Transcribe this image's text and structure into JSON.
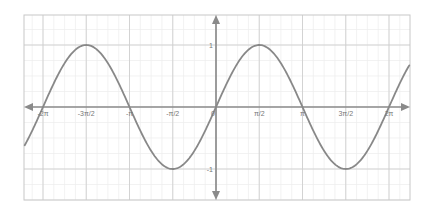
{
  "chart_data": {
    "type": "line",
    "title": "",
    "xlabel": "",
    "ylabel": "",
    "function": "y = sin(x)",
    "xlim": [
      -7.2,
      7.2
    ],
    "ylim": [
      -1.65,
      1.65
    ],
    "grid": true,
    "legend": null,
    "x_ticks": [
      {
        "value": -6.2832,
        "label": "-2π"
      },
      {
        "value": -4.7124,
        "label": "-3π/2"
      },
      {
        "value": -3.1416,
        "label": "-π"
      },
      {
        "value": -1.5708,
        "label": "-π/2"
      },
      {
        "value": 0,
        "label": "0"
      },
      {
        "value": 1.5708,
        "label": "π/2"
      },
      {
        "value": 3.1416,
        "label": "π"
      },
      {
        "value": 4.7124,
        "label": "3π/2"
      },
      {
        "value": 6.2832,
        "label": "2π"
      }
    ],
    "y_ticks": [
      {
        "value": 1,
        "label": "1"
      },
      {
        "value": -1,
        "label": "-1"
      }
    ],
    "series": [
      {
        "name": "sin(x)",
        "color": "#888888",
        "x": [
          -7.2,
          -6.2832,
          -5.4978,
          -4.7124,
          -3.927,
          -3.1416,
          -2.3562,
          -1.5708,
          -0.7854,
          0,
          0.7854,
          1.5708,
          2.3562,
          3.1416,
          3.927,
          4.7124,
          5.4978,
          6.2832,
          7.2
        ],
        "values": [
          -0.794,
          0,
          0.707,
          1,
          0.707,
          0,
          -0.707,
          -1,
          -0.707,
          0,
          0.707,
          1,
          0.707,
          0,
          -0.707,
          -1,
          -0.707,
          0,
          0.794
        ]
      }
    ]
  },
  "colors": {
    "curve": "#888888",
    "axis": "#8a8a8a",
    "major_grid": "#cfcfcf",
    "minor_grid": "#ececec",
    "border": "#c8c8c8",
    "label": "#777777"
  }
}
